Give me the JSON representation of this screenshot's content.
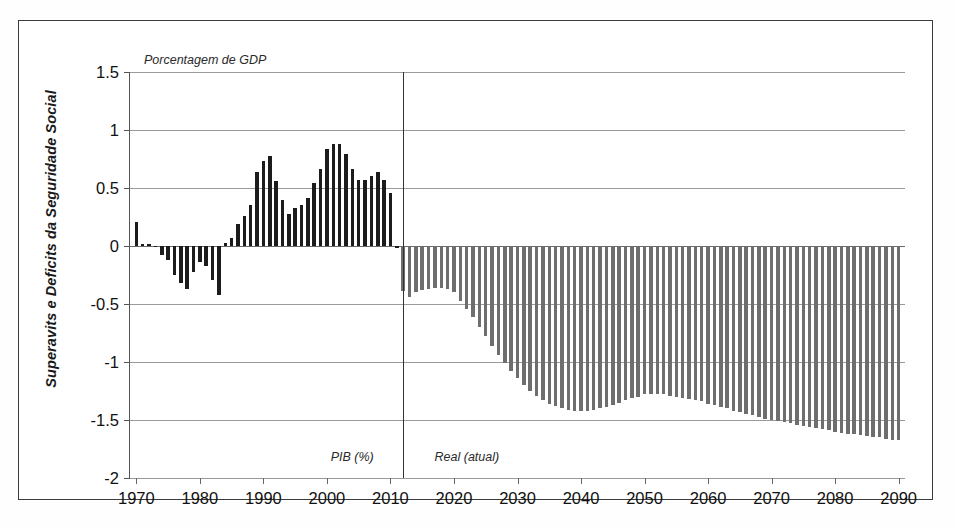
{
  "chart_data": {
    "type": "bar",
    "title": "",
    "subtitle": "",
    "units_note": "Porcentagem de GDP",
    "ylabel": "Superavits e Deficits da Seguridade Social",
    "xlabel": "",
    "ylim": [
      -2,
      1.5
    ],
    "ytick_step": 0.5,
    "xlim": [
      1969,
      2091
    ],
    "grid": true,
    "legend": false,
    "divider_year": 2012,
    "annotations": [
      {
        "name": "historical-label",
        "text": "PIB (%)",
        "year": 2008,
        "value": -1.88
      },
      {
        "name": "projection-label",
        "text": "Real (atual)",
        "year": 2016,
        "value": -1.88
      }
    ],
    "ytick_labels": [
      "1.5",
      "1",
      "0.5",
      "0",
      "-0.5",
      "-1",
      "-1.5",
      "-2"
    ],
    "ytick_values": [
      1.5,
      1,
      0.5,
      0,
      -0.5,
      -1,
      -1.5,
      -2
    ],
    "xtick_labels": [
      "1970",
      "1980",
      "1990",
      "2000",
      "2010",
      "2020",
      "2030",
      "2040",
      "2050",
      "2060",
      "2070",
      "2080",
      "2090"
    ],
    "xtick_values": [
      1970,
      1980,
      1990,
      2000,
      2010,
      2020,
      2030,
      2040,
      2050,
      2060,
      2070,
      2080,
      2090
    ],
    "colors": {
      "historical_bar": "#1c1c1c",
      "projection_bar": "#6e6e6e",
      "gridline": "#9a9a9a",
      "axis": "#555555",
      "frame": "#3c3c3c",
      "text": "#111111"
    },
    "series": [
      {
        "name": "Historico (PIB %)",
        "style": "historical",
        "x": [
          1970,
          1971,
          1972,
          1973,
          1974,
          1975,
          1976,
          1977,
          1978,
          1979,
          1980,
          1981,
          1982,
          1983,
          1984,
          1985,
          1986,
          1987,
          1988,
          1989,
          1990,
          1991,
          1992,
          1993,
          1994,
          1995,
          1996,
          1997,
          1998,
          1999,
          2000,
          2001,
          2002,
          2003,
          2004,
          2005,
          2006,
          2007,
          2008,
          2009,
          2010,
          2011
        ],
        "values": [
          0.21,
          0.02,
          0.02,
          -0.01,
          -0.08,
          -0.12,
          -0.25,
          -0.32,
          -0.37,
          -0.22,
          -0.14,
          -0.17,
          -0.29,
          -0.42,
          0.03,
          0.07,
          0.19,
          0.26,
          0.35,
          0.64,
          0.73,
          0.78,
          0.56,
          0.4,
          0.28,
          0.33,
          0.35,
          0.41,
          0.54,
          0.66,
          0.84,
          0.88,
          0.88,
          0.79,
          0.66,
          0.57,
          0.57,
          0.6,
          0.64,
          0.57,
          0.46,
          -0.02
        ]
      },
      {
        "name": "Projecao (Real atual)",
        "style": "projection",
        "x": [
          2012,
          2013,
          2014,
          2015,
          2016,
          2017,
          2018,
          2019,
          2020,
          2021,
          2022,
          2023,
          2024,
          2025,
          2026,
          2027,
          2028,
          2029,
          2030,
          2031,
          2032,
          2033,
          2034,
          2035,
          2036,
          2037,
          2038,
          2039,
          2040,
          2041,
          2042,
          2043,
          2044,
          2045,
          2046,
          2047,
          2048,
          2049,
          2050,
          2051,
          2052,
          2053,
          2054,
          2055,
          2056,
          2057,
          2058,
          2059,
          2060,
          2061,
          2062,
          2063,
          2064,
          2065,
          2066,
          2067,
          2068,
          2069,
          2070,
          2071,
          2072,
          2073,
          2074,
          2075,
          2076,
          2077,
          2078,
          2079,
          2080,
          2081,
          2082,
          2083,
          2084,
          2085,
          2086,
          2087,
          2088,
          2089,
          2090
        ],
        "values": [
          -0.39,
          -0.44,
          -0.4,
          -0.38,
          -0.37,
          -0.36,
          -0.36,
          -0.37,
          -0.4,
          -0.47,
          -0.54,
          -0.61,
          -0.7,
          -0.78,
          -0.86,
          -0.94,
          -1.01,
          -1.08,
          -1.14,
          -1.2,
          -1.25,
          -1.29,
          -1.33,
          -1.36,
          -1.38,
          -1.4,
          -1.41,
          -1.42,
          -1.42,
          -1.42,
          -1.41,
          -1.4,
          -1.39,
          -1.37,
          -1.35,
          -1.33,
          -1.31,
          -1.3,
          -1.28,
          -1.28,
          -1.28,
          -1.28,
          -1.29,
          -1.3,
          -1.31,
          -1.32,
          -1.33,
          -1.34,
          -1.36,
          -1.37,
          -1.39,
          -1.4,
          -1.42,
          -1.43,
          -1.45,
          -1.46,
          -1.47,
          -1.49,
          -1.5,
          -1.51,
          -1.52,
          -1.53,
          -1.54,
          -1.55,
          -1.56,
          -1.57,
          -1.58,
          -1.59,
          -1.6,
          -1.61,
          -1.62,
          -1.62,
          -1.63,
          -1.64,
          -1.65,
          -1.65,
          -1.66,
          -1.67,
          -1.67
        ]
      }
    ]
  }
}
